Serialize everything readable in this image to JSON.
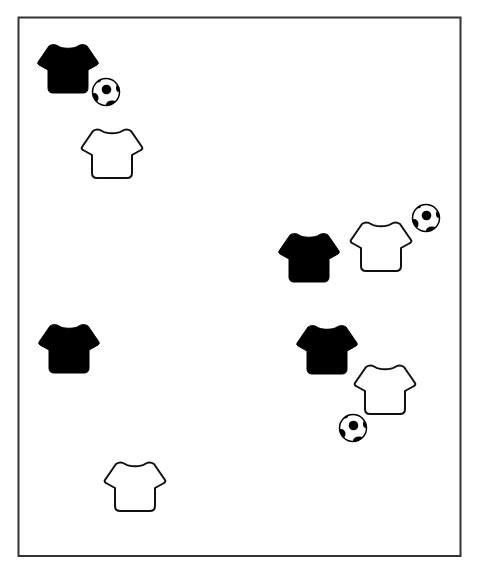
{
  "diagram": {
    "title": "Soccer drill setup",
    "frame_color": "#333333",
    "dark_team_color": "#000000",
    "light_team_color": "#ffffff",
    "outline_color": "#111111",
    "items": [
      {
        "kind": "shirt",
        "team": "dark",
        "name": "dark-shirt-1",
        "x": 68,
        "y": 69
      },
      {
        "kind": "ball",
        "name": "soccer-ball-1",
        "x": 106,
        "y": 92
      },
      {
        "kind": "shirt",
        "team": "light",
        "name": "light-shirt-1",
        "x": 112,
        "y": 154
      },
      {
        "kind": "shirt",
        "team": "dark",
        "name": "dark-shirt-2",
        "x": 309,
        "y": 258
      },
      {
        "kind": "shirt",
        "team": "light",
        "name": "light-shirt-2",
        "x": 381,
        "y": 247
      },
      {
        "kind": "ball",
        "name": "soccer-ball-2",
        "x": 426,
        "y": 218
      },
      {
        "kind": "shirt",
        "team": "dark",
        "name": "dark-shirt-3",
        "x": 327,
        "y": 350
      },
      {
        "kind": "shirt",
        "team": "light",
        "name": "light-shirt-3",
        "x": 385,
        "y": 390
      },
      {
        "kind": "ball",
        "name": "soccer-ball-3",
        "x": 353,
        "y": 428
      },
      {
        "kind": "shirt",
        "team": "dark",
        "name": "dark-shirt-4",
        "x": 69,
        "y": 349
      },
      {
        "kind": "shirt",
        "team": "light",
        "name": "light-shirt-4",
        "x": 135,
        "y": 487
      }
    ]
  }
}
